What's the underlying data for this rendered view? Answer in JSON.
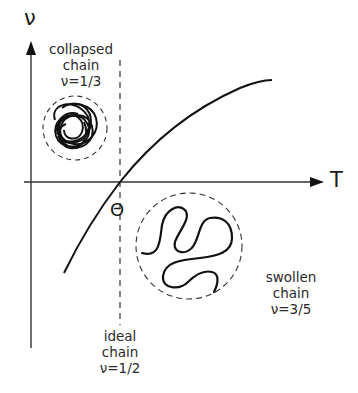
{
  "diagram": {
    "axes": {
      "y_label": "ν",
      "x_label": "T"
    },
    "theta_label": "Θ",
    "regions": [
      {
        "id": "collapsed",
        "line1": "collapsed",
        "line2": "chain",
        "line3": "ν=1/3"
      },
      {
        "id": "ideal",
        "line1": "ideal",
        "line2": "chain",
        "line3": "ν=1/2"
      },
      {
        "id": "swollen",
        "line1": "swollen",
        "line2": "chain",
        "line3": "ν=3/5"
      }
    ],
    "colors": {
      "line": "#111111",
      "axis": "#333333",
      "text": "#2a2a2a"
    }
  }
}
